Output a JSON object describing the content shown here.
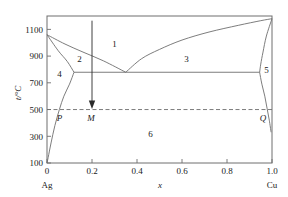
{
  "chart_data": {
    "type": "line",
    "title": "",
    "xlabel": "x",
    "ylabel": "t/°C",
    "xlim": [
      0,
      1.0
    ],
    "ylim": [
      100,
      1200
    ],
    "grid": false,
    "legend": "none",
    "x_ticks": [
      "0",
      "0.2",
      "0.4",
      "0.6",
      "0.8",
      "1.0"
    ],
    "x_tick_values": [
      0,
      0.2,
      0.4,
      0.6,
      0.8,
      1.0
    ],
    "y_ticks": [
      "100",
      "300",
      "500",
      "700",
      "900",
      "1100"
    ],
    "y_tick_values": [
      100,
      300,
      500,
      700,
      900,
      1100
    ],
    "left_component": "Ag",
    "right_component": "Cu",
    "eutectic": {
      "x": 0.35,
      "t": 779
    },
    "series": [
      {
        "name": "liquidus-Ag-side",
        "points": [
          [
            0.0,
            1060
          ],
          [
            0.08,
            990
          ],
          [
            0.16,
            930
          ],
          [
            0.25,
            865
          ],
          [
            0.35,
            779
          ]
        ]
      },
      {
        "name": "liquidus-Cu-side",
        "points": [
          [
            0.35,
            779
          ],
          [
            0.42,
            880
          ],
          [
            0.5,
            950
          ],
          [
            0.6,
            1020
          ],
          [
            0.72,
            1080
          ],
          [
            0.85,
            1130
          ],
          [
            0.95,
            1165
          ],
          [
            1.0,
            1180
          ]
        ]
      },
      {
        "name": "solidus-Ag-side",
        "points": [
          [
            0.0,
            1060
          ],
          [
            0.05,
            940
          ],
          [
            0.09,
            860
          ],
          [
            0.12,
            779
          ]
        ]
      },
      {
        "name": "solidus-Cu-side",
        "points": [
          [
            1.0,
            1180
          ],
          [
            0.975,
            1050
          ],
          [
            0.96,
            930
          ],
          [
            0.95,
            840
          ],
          [
            0.945,
            779
          ]
        ]
      },
      {
        "name": "solvus-Ag-side",
        "points": [
          [
            0.12,
            779
          ],
          [
            0.1,
            690
          ],
          [
            0.075,
            600
          ],
          [
            0.055,
            500
          ],
          [
            0.035,
            380
          ],
          [
            0.018,
            250
          ],
          [
            0.005,
            140
          ],
          [
            0.0,
            100
          ]
        ]
      },
      {
        "name": "solvus-Cu-side",
        "points": [
          [
            0.945,
            779
          ],
          [
            0.955,
            690
          ],
          [
            0.968,
            600
          ],
          [
            0.978,
            510
          ],
          [
            0.988,
            420
          ],
          [
            0.996,
            330
          ]
        ]
      },
      {
        "name": "eutectic-horizontal",
        "points": [
          [
            0.12,
            779
          ],
          [
            0.945,
            779
          ]
        ]
      },
      {
        "name": "isotherm-500",
        "style": "dashed",
        "points": [
          [
            0.0,
            500
          ],
          [
            1.0,
            500
          ]
        ]
      }
    ],
    "annotations": [
      {
        "label": "1",
        "x": 0.3,
        "t": 995,
        "kind": "region"
      },
      {
        "label": "2",
        "x": 0.145,
        "t": 880,
        "kind": "region"
      },
      {
        "label": "3",
        "x": 0.62,
        "t": 880,
        "kind": "region"
      },
      {
        "label": "4",
        "x": 0.055,
        "t": 770,
        "kind": "region"
      },
      {
        "label": "5",
        "x": 0.975,
        "t": 800,
        "kind": "region"
      },
      {
        "label": "6",
        "x": 0.46,
        "t": 320,
        "kind": "region"
      },
      {
        "label": "P",
        "x": 0.055,
        "t": 440,
        "kind": "point"
      },
      {
        "label": "M",
        "x": 0.195,
        "t": 440,
        "kind": "point"
      },
      {
        "label": "Q",
        "x": 0.96,
        "t": 440,
        "kind": "point"
      }
    ],
    "arrow": {
      "name": "cooling-path-arrow",
      "x": 0.2,
      "t_start": 1180,
      "t_end": 505,
      "direction": "down"
    }
  },
  "colors": {
    "line": "#6e6e6e",
    "text": "#1a1a1a",
    "arrow": "#2b2b2b",
    "background": "#ffffff"
  }
}
